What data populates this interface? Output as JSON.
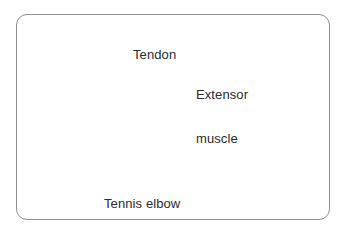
{
  "figure": {
    "border_color": "#8d8d8d",
    "background_color": "#ffffff",
    "label_color": "#2b2b2b",
    "leader_line_color": "#141414"
  },
  "labels": {
    "tendon": "Tendon",
    "extensor_line1": "Extensor",
    "extensor_line2": "muscle",
    "tennis_elbow": "Tennis elbow"
  },
  "anatomy": {
    "sleeve": {
      "name": "shirt-sleeve",
      "shade_top": "#b9b9b9",
      "shade_bottom": "#0b0b0b"
    },
    "upper_arm": {
      "name": "upper-arm",
      "shade": "#d3d3d3"
    },
    "tendon_fan": {
      "name": "common-extensor-tendon",
      "shade": "#fbfbfb"
    },
    "extensor_muscle": {
      "name": "extensor-muscle-belly",
      "shade": "#8a8a8a"
    },
    "forearm": {
      "name": "forearm",
      "shade": "#cfcfcf"
    },
    "hand": {
      "name": "closed-fist-hand",
      "shade": "#d6d6d6"
    }
  },
  "leaders": {
    "tendon_count": 1,
    "extensor_count": 3,
    "tennis_elbow_count": 1
  }
}
